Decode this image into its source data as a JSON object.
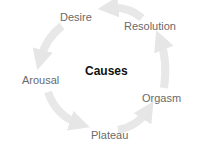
{
  "diagram": {
    "type": "cycle",
    "center_label": "Causes",
    "stages": [
      {
        "label": "Desire"
      },
      {
        "label": "Arousal"
      },
      {
        "label": "Plateau"
      },
      {
        "label": "Orgasm"
      },
      {
        "label": "Resolution"
      }
    ],
    "colors": {
      "arrow": "#e6e6e6",
      "label": "#6a6a6a",
      "center": "#111111"
    }
  }
}
